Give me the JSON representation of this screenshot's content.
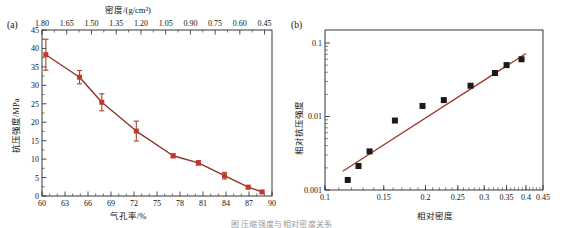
{
  "figure": {
    "caption": "图 压缩强度与相对密度关系",
    "line_color": "#b0402f",
    "marker_color_a": "#c0392b",
    "marker_color_b": "#1a1a1a",
    "axis_color": "#222222"
  },
  "panels": [
    {
      "label": "(a)",
      "top_axis_title": "密度/(g/cm³)",
      "x_axis_title": "气孔率/%",
      "y_axis_title": "抗压强度/MPa",
      "top_ticks": [
        "1.80",
        "1.65",
        "1.50",
        "1.35",
        "1.20",
        "1.05",
        "0.90",
        "0.75",
        "0.60",
        "0.45"
      ],
      "x_ticks": [
        "60",
        "63",
        "66",
        "69",
        "72",
        "75",
        "78",
        "81",
        "84",
        "87",
        "90"
      ],
      "y_ticks": [
        "0",
        "5",
        "10",
        "15",
        "20",
        "25",
        "30",
        "35",
        "40",
        "45"
      ]
    },
    {
      "label": "(b)",
      "x_axis_title": "相对密度",
      "y_axis_title": "相对抗压强度",
      "x_ticks": [
        "0.1",
        "0.15",
        "0.2",
        "0.25",
        "0.3",
        "0.35",
        "0.4",
        "0.45"
      ],
      "y_ticks": [
        "0.001",
        "0.01",
        "0.1"
      ]
    }
  ],
  "chart_data": [
    {
      "type": "line",
      "title": "(a)",
      "xlabel": "气孔率/%",
      "ylabel": "抗压强度/MPa",
      "xlim": [
        60,
        90
      ],
      "ylim": [
        0,
        45
      ],
      "top_axis_label": "密度/(g/cm³)",
      "top_axis_ticks": [
        1.8,
        1.65,
        1.5,
        1.35,
        1.2,
        1.05,
        0.9,
        0.75,
        0.6,
        0.45
      ],
      "x_ticks": [
        60,
        63,
        66,
        69,
        72,
        75,
        78,
        81,
        84,
        87,
        90
      ],
      "y_ticks": [
        0,
        5,
        10,
        15,
        20,
        25,
        30,
        35,
        40,
        45
      ],
      "grid": false,
      "legend": "none",
      "series": [
        {
          "name": "抗压强度",
          "x": [
            60.5,
            64.9,
            67.8,
            72.3,
            77.1,
            80.4,
            83.8,
            86.9,
            88.7
          ],
          "values": [
            38.3,
            32.2,
            25.4,
            17.6,
            10.9,
            9.0,
            5.5,
            2.4,
            1.1
          ],
          "yerr": [
            4.2,
            1.8,
            2.3,
            2.7,
            0.5,
            0.6,
            0.9,
            0.4,
            0.3
          ]
        }
      ]
    },
    {
      "type": "scatter",
      "title": "(b)",
      "xlabel": "相对密度",
      "ylabel": "相对抗压强度",
      "xscale": "log",
      "yscale": "log",
      "xlim": [
        0.1,
        0.45
      ],
      "ylim": [
        0.001,
        0.15
      ],
      "x_ticks": [
        0.1,
        0.15,
        0.2,
        0.25,
        0.3,
        0.35,
        0.4,
        0.45
      ],
      "y_ticks": [
        0.001,
        0.01,
        0.1
      ],
      "grid": false,
      "legend": "none",
      "series": [
        {
          "name": "相对抗压强度",
          "x": [
            0.117,
            0.126,
            0.136,
            0.162,
            0.196,
            0.227,
            0.273,
            0.323,
            0.35,
            0.388
          ],
          "values": [
            0.00137,
            0.00212,
            0.00335,
            0.0088,
            0.0139,
            0.0167,
            0.0262,
            0.039,
            0.05,
            0.06
          ]
        }
      ],
      "fit_line": {
        "name": "power-law fit",
        "x": [
          0.113,
          0.4
        ],
        "values": [
          0.0018,
          0.072
        ]
      }
    }
  ]
}
